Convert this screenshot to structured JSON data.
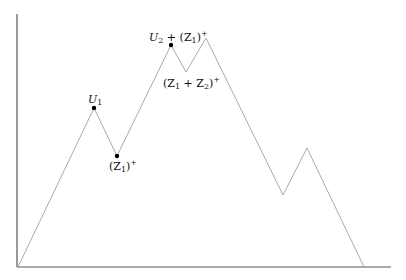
{
  "diagram": {
    "type": "piecewise-linear path (excursion)",
    "axes": {
      "y_axis": {
        "x": 17,
        "y1": 14,
        "y2": 267,
        "color": "#555555"
      },
      "x_axis": {
        "y": 267,
        "x1": 17,
        "x2": 391,
        "color": "#555555"
      }
    },
    "path": {
      "color": "#aaaaaa",
      "points": [
        [
          18,
          267
        ],
        [
          94,
          108
        ],
        [
          117,
          156
        ],
        [
          171,
          45
        ],
        [
          186,
          72
        ],
        [
          206,
          38
        ],
        [
          283,
          195
        ],
        [
          307,
          148
        ],
        [
          364,
          267
        ]
      ]
    },
    "marked_points": [
      {
        "name": "U1",
        "x": 94,
        "y": 108,
        "label_main": "U",
        "label_sub": "1",
        "label_x": 88,
        "label_y": 103
      },
      {
        "name": "Z1-plus",
        "x": 117,
        "y": 156,
        "label_pre": "(Z",
        "label_sub": "1",
        "label_post": ")",
        "label_sup": "+",
        "label_x": 109,
        "label_y": 170
      },
      {
        "name": "U2-plus-Z1-plus",
        "x": 171,
        "y": 45,
        "label_x": 149,
        "label_y": 41
      }
    ],
    "labels": {
      "u1": {
        "main": "U",
        "sub": "1"
      },
      "z1_plus": {
        "open": "(Z",
        "sub": "1",
        "close": ")",
        "sup": "+"
      },
      "u2_plus_z1_plus": {
        "u": "U",
        "u_sub": "2",
        "plus": " + (Z",
        "z_sub": "1",
        "close": ")",
        "sup": "+"
      },
      "z1_plus_z2_plus": {
        "open": "(Z",
        "sub1": "1",
        "plus": " + Z",
        "sub2": "2",
        "close": ")",
        "sup": "+"
      }
    }
  }
}
